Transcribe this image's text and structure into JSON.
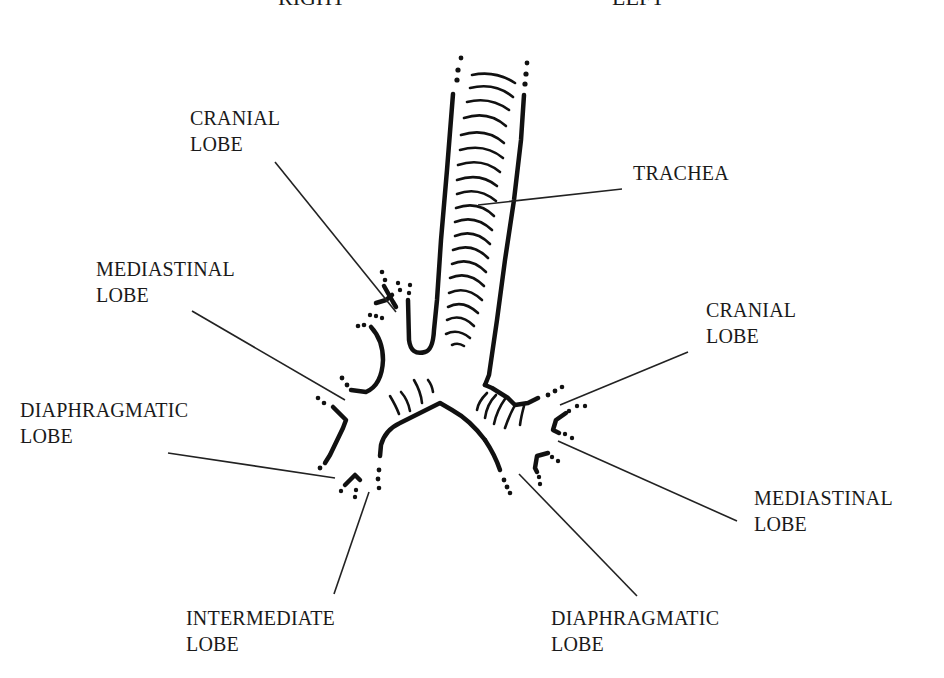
{
  "diagram": {
    "headers": {
      "right": "RIGHT",
      "left": "LEFT"
    },
    "labels": {
      "right_cranial": {
        "line1": "CRANIAL",
        "line2": "LOBE"
      },
      "right_mediastinal": {
        "line1": "MEDIASTINAL",
        "line2": "LOBE"
      },
      "right_diaphragmatic": {
        "line1": "DIAPHRAGMATIC",
        "line2": "LOBE"
      },
      "intermediate": {
        "line1": "INTERMEDIATE",
        "line2": "LOBE"
      },
      "trachea": {
        "line1": "TRACHEA"
      },
      "left_cranial": {
        "line1": "CRANIAL",
        "line2": "LOBE"
      },
      "left_mediastinal": {
        "line1": "MEDIASTINAL",
        "line2": "LOBE"
      },
      "left_diaphragmatic": {
        "line1": "DIAPHRAGMATIC",
        "line2": "LOBE"
      }
    },
    "colors": {
      "ink": "#111111",
      "background": "#ffffff"
    }
  }
}
